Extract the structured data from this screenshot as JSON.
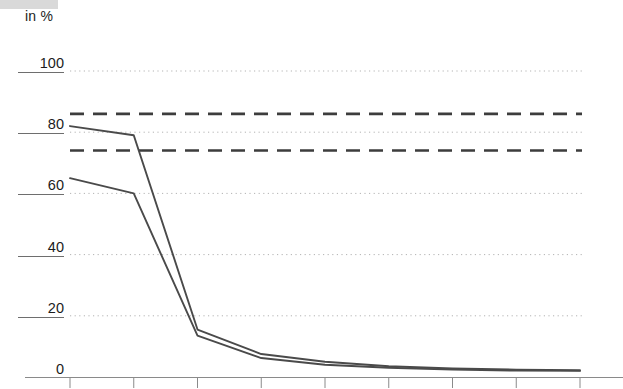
{
  "chart_data": {
    "type": "line",
    "title": "",
    "subtitle": "",
    "xlabel": "",
    "ylabel": "in %",
    "ylim": [
      0,
      100
    ],
    "yticks": [
      0,
      20,
      40,
      60,
      80,
      100
    ],
    "ytick_labels": [
      "0",
      "20",
      "40",
      "60",
      "80",
      "100"
    ],
    "grid": true,
    "grid_style": "dotted",
    "legend": "none",
    "x": [
      1,
      2,
      3,
      4,
      5,
      6,
      7,
      8,
      9
    ],
    "xtick_labels": [
      "",
      "",
      "",
      "",
      "",
      "",
      "",
      "",
      ""
    ],
    "series": [
      {
        "name": "series-upper-solid",
        "style": "solid",
        "color": "#4a4a4a",
        "values": [
          82,
          79,
          15.5,
          7.5,
          5,
          3.5,
          2.8,
          2.4,
          2.2
        ]
      },
      {
        "name": "series-lower-solid",
        "style": "solid",
        "color": "#4a4a4a",
        "values": [
          65,
          60,
          13.5,
          6.2,
          4,
          3,
          2.4,
          2.1,
          2.0
        ]
      },
      {
        "name": "reference-upper-dashed",
        "style": "dashed",
        "color": "#3d3d3d",
        "values": [
          86,
          86,
          86,
          86,
          86,
          86,
          86,
          86,
          86
        ]
      },
      {
        "name": "reference-lower-dashed",
        "style": "dashed",
        "color": "#3d3d3d",
        "values": [
          74,
          74,
          74,
          74,
          74,
          74,
          74,
          74,
          74
        ]
      }
    ],
    "colors": {
      "line": "#4a4a4a",
      "dashed": "#3d3d3d",
      "grid": "#b3b3b3",
      "axis": "#8a8a8a",
      "text": "#1c1c1c",
      "swatch": "#d9d9d9"
    }
  },
  "labels": {
    "unit": "in %",
    "y": [
      "100",
      "80",
      "60",
      "40",
      "20",
      "0"
    ]
  }
}
